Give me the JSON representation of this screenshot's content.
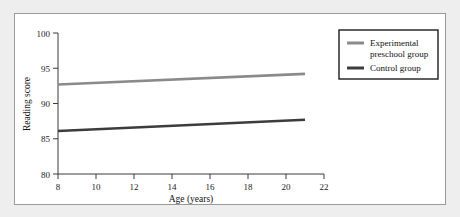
{
  "figure": {
    "background_color": "#ffffff",
    "page_background_color": "#eeeeee",
    "frame_color": "#9a9a9a"
  },
  "chart_data": {
    "type": "line",
    "title": "",
    "xlabel": "Age (years)",
    "ylabel": "Reading score",
    "xlim": [
      8,
      22
    ],
    "ylim": [
      80,
      100
    ],
    "xticks": [
      8,
      10,
      12,
      14,
      16,
      18,
      20,
      22
    ],
    "yticks": [
      80,
      85,
      90,
      95,
      100
    ],
    "xtick_labels": [
      "8",
      "10",
      "12",
      "14",
      "16",
      "18",
      "20",
      "22"
    ],
    "ytick_labels": [
      "80",
      "85",
      "90",
      "95",
      "100"
    ],
    "grid": false,
    "legend_position": "upper right",
    "x": [
      8,
      21
    ],
    "series": [
      {
        "name": "Experimental preschool group",
        "values": [
          92.7,
          94.2
        ],
        "color": "#8a8a8a",
        "line_width": 2.6
      },
      {
        "name": "Control group",
        "values": [
          86.1,
          87.7
        ],
        "color": "#3c3c3c",
        "line_width": 2.6
      }
    ],
    "legend_entries": [
      {
        "label_line1": "Experimental",
        "label_line2": "preschool group",
        "color": "#8a8a8a"
      },
      {
        "label_line1": "Control group",
        "label_line2": "",
        "color": "#3c3c3c"
      }
    ]
  }
}
